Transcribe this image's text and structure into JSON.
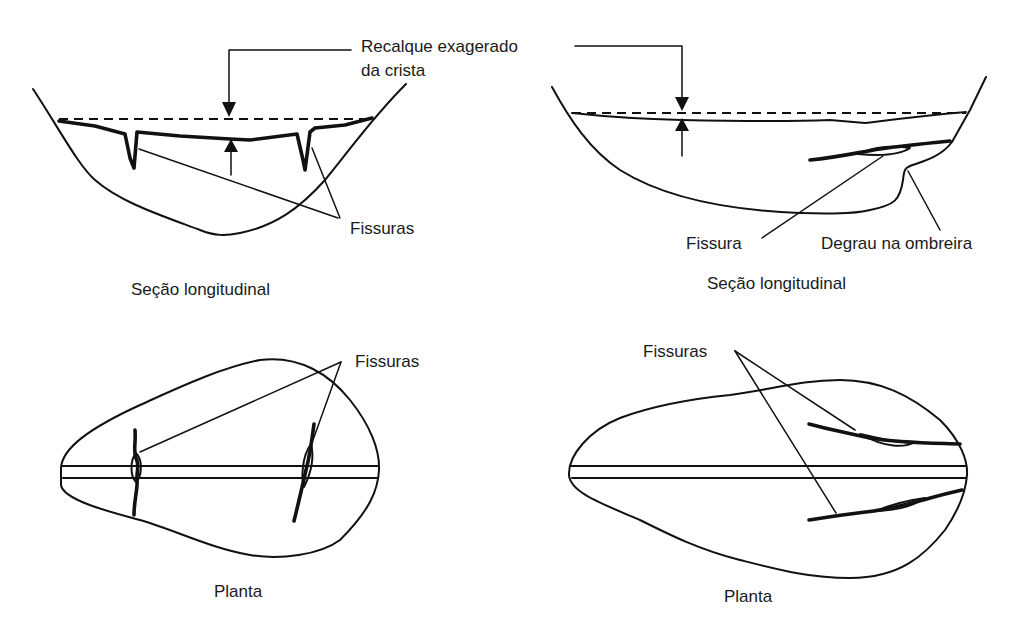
{
  "labels": {
    "settlement": "Recalque exagerado",
    "settlement_line2": "da crista",
    "cracks_top_left": "Fissuras",
    "section_left": "Seção longitudinal",
    "crack_top_right": "Fissura",
    "step_abutment": "Degrau na ombreira",
    "section_right": "Seção longitudinal",
    "cracks_bottom_left": "Fissuras",
    "plan_left": "Planta",
    "cracks_bottom_right": "Fissuras",
    "plan_right": "Planta"
  },
  "panels": [
    {
      "id": "top-left",
      "view": "Seção longitudinal",
      "features": [
        "crest settlement",
        "2 transverse cracks"
      ]
    },
    {
      "id": "top-right",
      "view": "Seção longitudinal",
      "features": [
        "crest settlement",
        "longitudinal crack",
        "abutment step"
      ]
    },
    {
      "id": "bottom-left",
      "view": "Planta",
      "features": [
        "2 transverse cracks across crest"
      ]
    },
    {
      "id": "bottom-right",
      "view": "Planta",
      "features": [
        "2 longitudinal cracks near abutment"
      ]
    }
  ],
  "colors": {
    "line": "#111111",
    "background": "#ffffff"
  }
}
